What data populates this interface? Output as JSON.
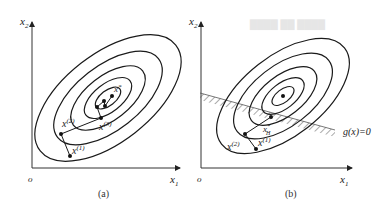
{
  "figure": {
    "panels": [
      {
        "id": "a",
        "caption": "(a)",
        "axis_x_label": "x",
        "axis_x_sub": "1",
        "axis_y_label": "x",
        "axis_y_sub": "2",
        "origin_label": "o",
        "points": [
          {
            "label": "x",
            "sup": "(1)"
          },
          {
            "label": "x",
            "sup": "(2)"
          },
          {
            "label": "x",
            "sup": "(3)"
          },
          {
            "label": "x",
            "sup": "*"
          }
        ]
      },
      {
        "id": "b",
        "caption": "(b)",
        "axis_x_label": "x",
        "axis_x_sub": "1",
        "axis_y_label": "x",
        "axis_y_sub": "2",
        "origin_label": "o",
        "constraint_label": "g(x)=0",
        "points": [
          {
            "label": "x",
            "sup": "(1)"
          },
          {
            "label": "x",
            "sup": "(2)"
          },
          {
            "label": "x",
            "sup": "*",
            "sub": "H"
          }
        ]
      }
    ]
  },
  "colors": {
    "stroke": "#1a1a1a",
    "hatch": "#555555",
    "background": "#ffffff"
  }
}
